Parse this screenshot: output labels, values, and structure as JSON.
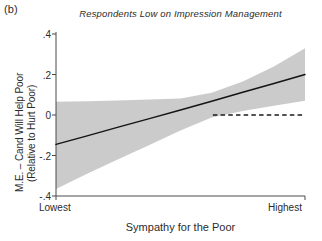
{
  "panel": {
    "label": "(b)"
  },
  "chart_data": {
    "type": "line",
    "title": "Respondents Low on Impression Management",
    "xlabel": "Sympathy for the Poor",
    "ylabel_line1": "M.E. – Cand Will Help Poor",
    "ylabel_line2": "(Relative to Hurt Poor)",
    "xlim": [
      0,
      1
    ],
    "ylim": [
      -0.4,
      0.4
    ],
    "yticks": [
      0.4,
      0.2,
      0,
      -0.2,
      -0.4
    ],
    "ytick_labels": [
      ".4",
      ".2",
      "0",
      "-.2",
      "-.4"
    ],
    "xticks": [
      0,
      1
    ],
    "xtick_labels": [
      "Lowest",
      "Highest"
    ],
    "grid": false,
    "legend": null,
    "series": [
      {
        "name": "Marginal effect (fitted)",
        "style": "solid",
        "color": "#1a1a1a",
        "x": [
          0.0,
          0.125,
          0.25,
          0.375,
          0.5,
          0.625,
          0.75,
          0.875,
          1.0
        ],
        "values": [
          -0.145,
          -0.103,
          -0.06,
          -0.018,
          0.025,
          0.068,
          0.112,
          0.156,
          0.2
        ]
      },
      {
        "name": "95% confidence interval upper",
        "style": "band-upper",
        "color": "#c9c9c9",
        "x": [
          0.0,
          0.125,
          0.25,
          0.375,
          0.5,
          0.625,
          0.75,
          0.875,
          1.0
        ],
        "values": [
          0.065,
          0.068,
          0.072,
          0.076,
          0.082,
          0.11,
          0.165,
          0.24,
          0.33
        ]
      },
      {
        "name": "95% confidence interval lower",
        "style": "band-lower",
        "color": "#c9c9c9",
        "x": [
          0.0,
          0.125,
          0.25,
          0.375,
          0.5,
          0.625,
          0.75,
          0.875,
          1.0
        ],
        "values": [
          -0.365,
          -0.29,
          -0.218,
          -0.148,
          -0.077,
          -0.012,
          0.02,
          0.046,
          0.07
        ]
      },
      {
        "name": "Zero reference line",
        "style": "dashed",
        "color": "#1a1a1a",
        "x": [
          0.63,
          1.0
        ],
        "values": [
          0.0,
          0.0
        ]
      }
    ]
  }
}
